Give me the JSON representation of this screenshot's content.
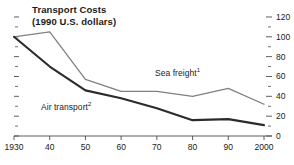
{
  "title": {
    "line1": "Transport Costs",
    "line2": "(1990 U.S. dollars)"
  },
  "labels": {
    "sea_freight": "Sea freight",
    "sea_freight_note": "1",
    "air_transport": "Air transport",
    "air_transport_note": "2"
  },
  "colors": {
    "air_transport": "#2b2b2b",
    "sea_freight": "#808080",
    "axis": "#4d4d4d",
    "text": "#1a1a1a",
    "background": "#ffffff"
  },
  "chart_data": {
    "type": "line",
    "title": "Transport Costs (1990 U.S. dollars)",
    "xlabel": "",
    "ylabel": "",
    "x": [
      1930,
      1940,
      1950,
      1960,
      1970,
      1980,
      1990,
      2000
    ],
    "categories": [
      "1930",
      "40",
      "50",
      "60",
      "70",
      "80",
      "90",
      "2000"
    ],
    "xtick_labels": [
      "1930",
      "40",
      "50",
      "60",
      "70",
      "80",
      "90",
      "2000"
    ],
    "ytick_labels": [
      "0",
      "20",
      "40",
      "60",
      "80",
      "100",
      "120"
    ],
    "ytick_values": [
      0,
      20,
      40,
      60,
      80,
      100,
      120
    ],
    "yminor_values": [
      10,
      30,
      50,
      70,
      90,
      110
    ],
    "ylim": [
      0,
      125
    ],
    "xlim": [
      1930,
      2000
    ],
    "yaxis_position": "right",
    "grid": false,
    "legend": "inline-annotations",
    "series": [
      {
        "name": "Sea freight",
        "note": "1",
        "values": [
          100,
          105,
          57,
          45,
          45,
          40,
          48,
          32
        ]
      },
      {
        "name": "Air transport",
        "note": "2",
        "values": [
          100,
          70,
          46,
          38,
          28,
          16,
          17,
          11
        ]
      }
    ]
  }
}
